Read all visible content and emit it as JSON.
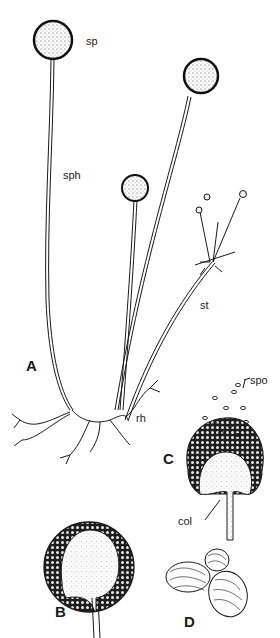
{
  "figure": {
    "panels": [
      {
        "id": "A",
        "label": "A"
      },
      {
        "id": "B",
        "label": "B"
      },
      {
        "id": "C",
        "label": "C"
      },
      {
        "id": "D",
        "label": "D"
      }
    ],
    "annotations": {
      "sp": "sp",
      "sph": "sph",
      "st": "st",
      "rh": "rh",
      "spo": "spo",
      "col": "col"
    },
    "colors": {
      "ink": "#1a1a1a",
      "paper": "#ffffff",
      "stipple": "#555555"
    }
  }
}
